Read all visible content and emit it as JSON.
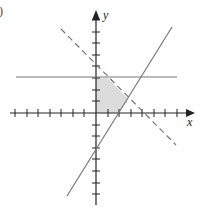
{
  "figure": {
    "part_label_fragment": ")",
    "x_axis_label": "x",
    "y_axis_label": "y"
  },
  "graph": {
    "origin_px": [
      96,
      113
    ],
    "unit_px": 11.6,
    "x_ticks": [
      -7,
      -6,
      -5,
      -4,
      -3,
      -2,
      -1,
      1,
      2,
      3,
      4,
      5,
      6,
      7
    ],
    "y_ticks": [
      -7,
      -6,
      -5,
      -4,
      -3,
      -2,
      -1,
      1,
      2,
      3,
      4,
      5,
      6,
      7,
      8
    ],
    "lines": [
      {
        "name": "horizontal-boundary",
        "equation": "y = 3",
        "style": "solid"
      },
      {
        "name": "dashed-boundary",
        "equation": "x + y = 4",
        "style": "dashed"
      },
      {
        "name": "diagonal-boundary",
        "equation": "y = 1.5x - 3",
        "style": "solid"
      }
    ],
    "shaded_region": {
      "description": "feasible region in first quadrant bounded by axes, y=3, x+y=4, y=1.5x-3",
      "vertices": [
        [
          0,
          0
        ],
        [
          0,
          3
        ],
        [
          1,
          3
        ],
        [
          2.8,
          1.2
        ],
        [
          2,
          0
        ]
      ],
      "fill": "#dcdcdc"
    },
    "colors": {
      "axis": "#222222",
      "line": "#777777",
      "shade": "#dcdcdc"
    }
  }
}
